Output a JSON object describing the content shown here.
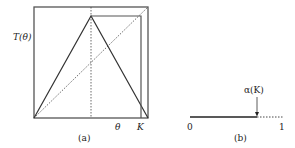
{
  "panel_a": {
    "y_label": "T(θ)",
    "x_label_theta": "θ",
    "x_label_K": "K",
    "caption": "(a)",
    "description": "Tent map T(θ) on unit square with identity diagonal (dotted), peak at midpoint (dotted vertical), and orbit box reaching K",
    "map_points": [
      [
        0,
        0
      ],
      [
        0.5,
        1
      ],
      [
        1,
        0
      ]
    ],
    "identity_line": [
      [
        0,
        0
      ],
      [
        1,
        1
      ]
    ],
    "peak_x": 0.5,
    "K": 0.97,
    "orbit_top_y": 0.92
  },
  "panel_b": {
    "left_label": "0",
    "right_label": "1",
    "arrow_label": "α(K)",
    "caption": "(b)",
    "alpha_K_position": 0.73,
    "description": "Interval [0,1] with solid segment [0, α(K)] and dotted segment [α(K), 1]"
  }
}
